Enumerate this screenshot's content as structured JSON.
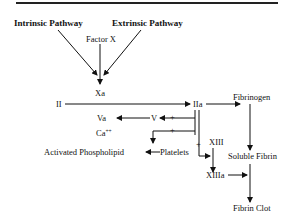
{
  "diagram": {
    "title_rule": true,
    "pathways": {
      "intrinsic": "Intrinsic Pathway",
      "extrinsic": "Extrinsic Pathway"
    },
    "nodes": {
      "factor_x": "Factor X",
      "xa": "Xa",
      "ii": "II",
      "iia": "IIa",
      "fibrinogen": "Fibrinogen",
      "va": "Va",
      "v": "V",
      "ca": "Ca",
      "ca_sup": "++",
      "activated_phospholipid": "Activated Phospholipid",
      "platelets": "Platelets",
      "xiii": "XIII",
      "xiiia": "XIIIa",
      "soluble_fibrin": "Soluble Fibrin",
      "fibrin_clot": "Fibrin Clot"
    },
    "plus_sign": "+",
    "edges": [
      {
        "from": "Intrinsic Pathway",
        "to": "Xa"
      },
      {
        "from": "Extrinsic Pathway",
        "to": "Xa"
      },
      {
        "from": "Factor X",
        "to": "Xa"
      },
      {
        "from": "II",
        "to": "IIa"
      },
      {
        "from": "IIa",
        "to": "V",
        "sign": "+"
      },
      {
        "from": "V",
        "to": "Va"
      },
      {
        "from": "IIa",
        "to": "Platelets",
        "sign": "+"
      },
      {
        "from": "Platelets",
        "to": "Activated Phospholipid"
      },
      {
        "from": "IIa",
        "to": "XIII",
        "sign": "+"
      },
      {
        "from": "XIII",
        "to": "XIIIa"
      },
      {
        "from": "IIa",
        "to": "Soluble Fibrin"
      },
      {
        "from": "Fibrinogen",
        "to": "Soluble Fibrin"
      },
      {
        "from": "XIIIa",
        "to": "Fibrin Clot"
      },
      {
        "from": "Soluble Fibrin",
        "to": "Fibrin Clot"
      }
    ]
  }
}
